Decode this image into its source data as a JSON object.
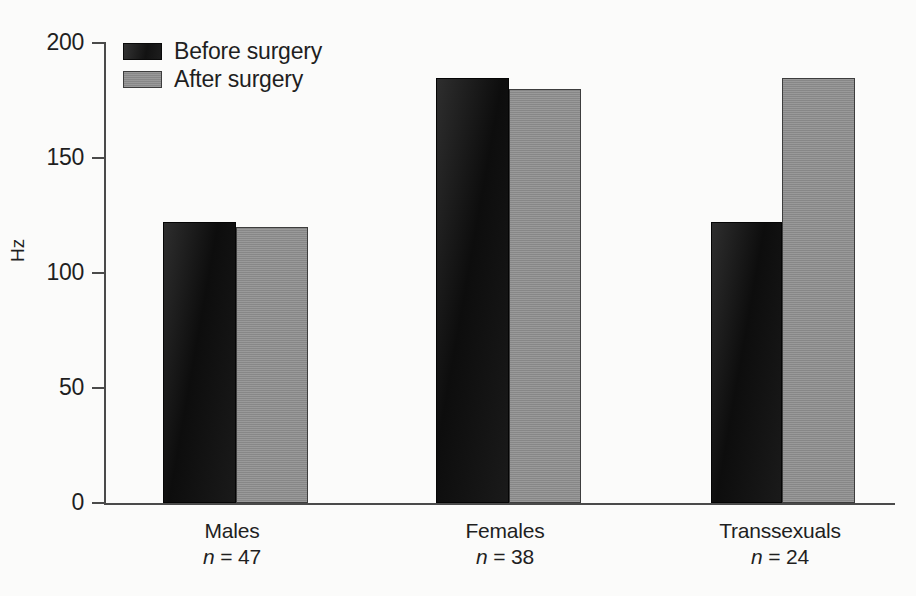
{
  "chart_data": {
    "type": "bar",
    "title": "",
    "xlabel": "",
    "ylabel": "Hz",
    "ylim": [
      0,
      200
    ],
    "yticks": [
      0,
      50,
      100,
      150,
      200
    ],
    "ytick_labels": [
      "0",
      "50",
      "100",
      "150",
      "200"
    ],
    "grid": false,
    "legend_position": "top-left",
    "categories": [
      "Males",
      "Females",
      "Transsexuals"
    ],
    "category_subtitles": [
      "n = 47",
      "n = 38",
      "n = 24"
    ],
    "group_sizes": [
      47,
      38,
      24
    ],
    "series": [
      {
        "name": "Before surgery",
        "values": [
          122,
          185,
          122
        ],
        "color": "#1b1b1b"
      },
      {
        "name": "After surgery",
        "values": [
          120,
          180,
          185
        ],
        "color": "#8e8e8e"
      }
    ]
  },
  "axis": {
    "y_title": "Hz",
    "tick_labels": {
      "t200": "200",
      "t150": "150",
      "t100": "100",
      "t50": "50",
      "t0": "0"
    }
  },
  "legend": {
    "items": [
      {
        "label": "Before surgery",
        "swatch": "dark-square-swatch"
      },
      {
        "label": "After surgery",
        "swatch": "gray-square-swatch"
      }
    ]
  },
  "groups": [
    {
      "name": "Males",
      "n_text": "n",
      "n_value": " = 47"
    },
    {
      "name": "Females",
      "n_text": "n",
      "n_value": " = 38"
    },
    {
      "name": "Transsexuals",
      "n_text": "n",
      "n_value": " = 24"
    }
  ]
}
